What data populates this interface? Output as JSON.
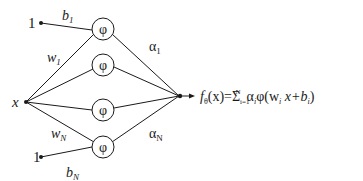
{
  "diagram": {
    "input_label": "x",
    "bias_input_top": "1",
    "bias_input_bottom": "1",
    "bias_top_label": "b",
    "bias_top_sub": "1",
    "bias_bottom_label": "b",
    "bias_bottom_sub": "N",
    "weight_top_label": "w",
    "weight_top_sub": "1",
    "weight_bottom_label": "w",
    "weight_bottom_sub": "N",
    "alpha_top_label": "α",
    "alpha_top_sub": "1",
    "alpha_bottom_label": "α",
    "alpha_bottom_sub": "N",
    "activation": [
      "φ",
      "φ",
      "φ",
      "φ"
    ],
    "output": {
      "f": "f",
      "f_sub": "θ",
      "lhs_rest": "(x)=Σ",
      "sum_sub": "i=1",
      "sum_sup": "N",
      "rhs": "α",
      "rhs_sub1": "i",
      "rhs_phi": "φ(w",
      "rhs_sub2": "i",
      "rhs_mid": " x+b",
      "rhs_sub3": "i",
      "rhs_end": ")"
    }
  }
}
